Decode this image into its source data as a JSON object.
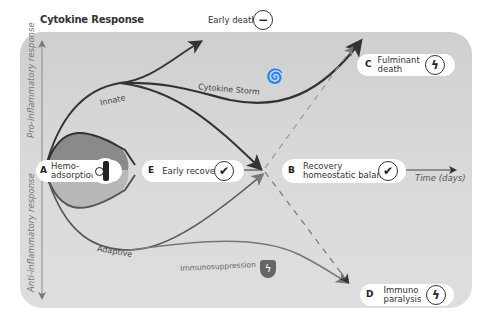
{
  "title": "Cytokine Response",
  "axes": {
    "y_top_label": "Pro-inflammatory response",
    "y_bottom_label": "Anti-inflammatory response",
    "x_label": "Time (days)"
  },
  "curve_labels": {
    "innate": "Innate",
    "cytokine_storm": "Cytokine Storm",
    "adaptive": "Adaptive",
    "immunosuppression": "Immunosuppression"
  },
  "outcomes": {
    "early_death": {
      "letter": "",
      "label": "Early death",
      "icon": "minus-circle-icon"
    },
    "fulminant_death": {
      "letter": "C",
      "label_line1": "Fulminant",
      "label_line2": "death",
      "icon": "lightning-circle-icon"
    },
    "hemoadsorption": {
      "letter": "A",
      "label_line1": "Hemo-",
      "label_line2": "adsorption",
      "icon": "filter-cartridge-icon"
    },
    "early_recovery": {
      "letter": "E",
      "label": "Early recovery",
      "icon": "check-circle-icon"
    },
    "recovery": {
      "letter": "B",
      "label_line1": "Recovery",
      "label_line2": "homeostatic balance",
      "icon": "check-circle-icon"
    },
    "immuno_paralysis": {
      "letter": "D",
      "label_line1": "Immuno",
      "label_line2": "paralysis",
      "icon": "broken-shield-icon"
    }
  },
  "colors": {
    "panel": "#d6d6d6",
    "curve_dark": "#333333",
    "curve_grey": "#777777",
    "hemo_upper": "#8a8a8a",
    "hemo_lower": "#b5b5b5",
    "dashed": "#999999"
  }
}
